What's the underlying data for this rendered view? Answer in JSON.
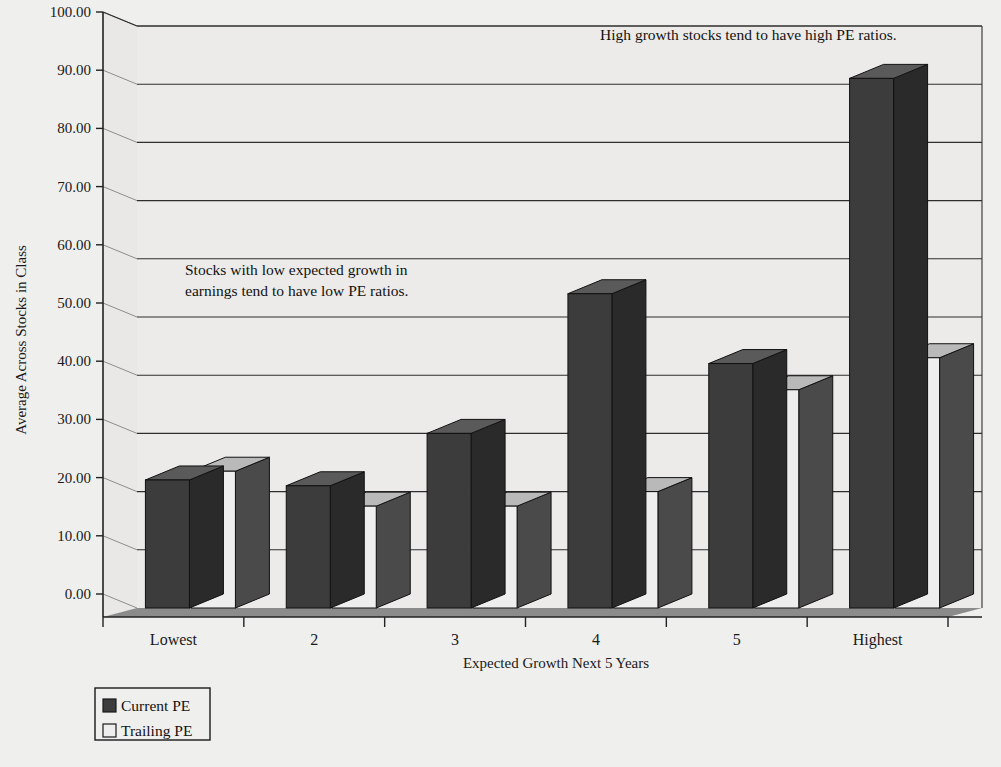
{
  "chart_data": {
    "type": "bar",
    "title": "",
    "xlabel": "Expected Growth Next 5 Years",
    "ylabel": "Average Across Stocks in Class",
    "categories": [
      "Lowest",
      "2",
      "3",
      "4",
      "5",
      "Highest"
    ],
    "series": [
      {
        "name": "Current PE",
        "values": [
          22.0,
          21.0,
          30.0,
          54.0,
          42.0,
          91.0
        ],
        "color": "#3c3c3c"
      },
      {
        "name": "Trailing PE",
        "values": [
          23.5,
          17.5,
          17.5,
          20.0,
          37.5,
          43.0
        ],
        "color": "#eeeeee"
      }
    ],
    "ylim": [
      0,
      100
    ],
    "ytick_step": 10,
    "ytick_labels": [
      "0.00",
      "10.00",
      "20.00",
      "30.00",
      "40.00",
      "50.00",
      "60.00",
      "70.00",
      "80.00",
      "90.00",
      "100.00"
    ],
    "grid": true,
    "legend_position": "bottom-left",
    "style": "3d-columns",
    "annotations": [
      {
        "id": "high-growth-note",
        "lines": [
          "High growth stocks tend to have high PE ratios."
        ],
        "x": 600,
        "y": 40
      },
      {
        "id": "low-growth-note",
        "lines": [
          "Stocks with low expected growth in",
          "earnings tend to have low PE ratios."
        ],
        "x": 185,
        "y": 275
      }
    ]
  },
  "legend": {
    "items": [
      {
        "label": "Current PE",
        "swatch": "dark"
      },
      {
        "label": "Trailing PE",
        "swatch": "light"
      }
    ]
  },
  "colors": {
    "background": "#efefed",
    "wall": "#ecebe9",
    "floor": "#8b8b8b",
    "gridline": "#2e2e2e",
    "dark_bar_front": "#3c3c3c",
    "dark_bar_side": "#2a2a2a",
    "dark_bar_top": "#5a5a5a",
    "light_bar_front": "#eeeeee",
    "light_bar_side": "#4a4a4a",
    "light_bar_top": "#b9b9b9"
  }
}
